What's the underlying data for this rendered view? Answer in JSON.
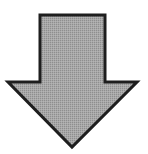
{
  "diagram": {
    "shape": "down-arrow",
    "icon": "arrow-down-icon",
    "fill_color": "#a3a3a3",
    "fill_pattern_color": "#8c8c8c",
    "stroke_color": "#1e1e1e",
    "stroke_width": 3,
    "points": "40,15 105,15 105,82 137,82 72,147 8,82 40,82"
  }
}
